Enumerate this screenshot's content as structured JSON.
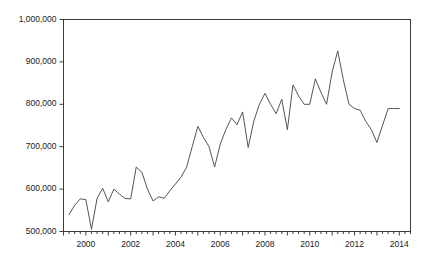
{
  "chart_data": {
    "type": "line",
    "title": "",
    "subtitle": "",
    "xlabel": "",
    "ylabel": "",
    "xlim": [
      1999.0,
      2014.5
    ],
    "ylim": [
      500000,
      1000000
    ],
    "grid": false,
    "legend": null,
    "y_ticks": [
      500000,
      600000,
      700000,
      800000,
      900000,
      1000000
    ],
    "y_tick_labels": [
      "500,000",
      "600,000",
      "700,000",
      "800,000",
      "900,000",
      "1,000,000"
    ],
    "x_ticks": [
      2000,
      2002,
      2004,
      2006,
      2008,
      2010,
      2012,
      2014
    ],
    "x_tick_labels": [
      "2000",
      "2002",
      "2004",
      "2006",
      "2008",
      "2010",
      "2012",
      "2014"
    ],
    "x_minor_tick_interval": 0.25,
    "line_color": "#555555",
    "line_width": 1,
    "series": [
      {
        "name": "series-1",
        "x": [
          1999.25,
          1999.5,
          1999.75,
          2000.0,
          2000.25,
          2000.5,
          2000.75,
          2001.0,
          2001.25,
          2001.5,
          2001.75,
          2002.0,
          2002.25,
          2002.5,
          2002.75,
          2003.0,
          2003.25,
          2003.5,
          2003.75,
          2004.0,
          2004.25,
          2004.5,
          2004.75,
          2005.0,
          2005.25,
          2005.5,
          2005.75,
          2006.0,
          2006.25,
          2006.5,
          2006.75,
          2007.0,
          2007.25,
          2007.5,
          2007.75,
          2008.0,
          2008.25,
          2008.5,
          2008.75,
          2009.0,
          2009.25,
          2009.5,
          2009.75,
          2010.0,
          2010.25,
          2010.5,
          2010.75,
          2011.0,
          2011.25,
          2011.5,
          2011.75,
          2012.0,
          2012.25,
          2012.5,
          2012.75,
          2013.0,
          2013.25,
          2013.5,
          2013.75,
          2014.0
        ],
        "values": [
          540000,
          562000,
          577000,
          575000,
          505000,
          578000,
          602000,
          570000,
          600000,
          588000,
          578000,
          577000,
          652000,
          640000,
          600000,
          572000,
          582000,
          578000,
          596000,
          612000,
          628000,
          652000,
          700000,
          748000,
          722000,
          700000,
          652000,
          706000,
          740000,
          768000,
          752000,
          782000,
          698000,
          760000,
          800000,
          826000,
          800000,
          778000,
          812000,
          740000,
          846000,
          820000,
          800000,
          800000,
          860000,
          828000,
          800000,
          876000,
          926000,
          858000,
          800000,
          790000,
          786000,
          760000,
          740000,
          710000,
          750000,
          790000,
          790000,
          790000
        ]
      }
    ]
  },
  "axes": {
    "frame_color": "#3c3c3c",
    "tick_color": "#3c3c3c"
  }
}
